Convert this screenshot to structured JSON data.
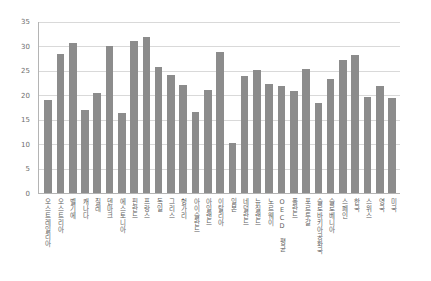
{
  "chart_data": {
    "type": "bar",
    "title": "",
    "xlabel": "",
    "ylabel": "",
    "ylim": [
      0,
      35
    ],
    "grid": true,
    "legend": "none",
    "bar_color": "#8c8c8c",
    "axis_color": "#b4b4b4",
    "gridline_color": "#d9d9d9",
    "ytick_labels": [
      "0",
      "5",
      "10",
      "15",
      "20",
      "25",
      "30",
      "35"
    ],
    "ytick_values": [
      0,
      5,
      10,
      15,
      20,
      25,
      30,
      35
    ],
    "categories": [
      "오스트레일리아",
      "오스트리아",
      "벨기에",
      "캐나다",
      "칠레",
      "덴마크",
      "에스토니아",
      "핀란드",
      "프랑스",
      "독일",
      "그리스",
      "헝가리",
      "아이슬란드",
      "아일랜드",
      "이탈리아",
      "일본",
      "네덜란드",
      "뉴질랜드",
      "노르웨이",
      "OECD 평균",
      "폴란드",
      "포르투갈",
      "슬로바키아공화국",
      "슬로베니아",
      "스페인",
      "한국",
      "스위스",
      "영국",
      "미국"
    ],
    "values": [
      19.0,
      28.4,
      30.7,
      17.0,
      20.5,
      30.1,
      16.3,
      31.1,
      32.0,
      25.8,
      24.1,
      22.1,
      16.6,
      21.0,
      28.8,
      10.3,
      23.9,
      25.2,
      22.3,
      21.9,
      20.9,
      25.4,
      18.5,
      23.3,
      27.3,
      28.3,
      19.7,
      22.0,
      19.5
    ]
  }
}
